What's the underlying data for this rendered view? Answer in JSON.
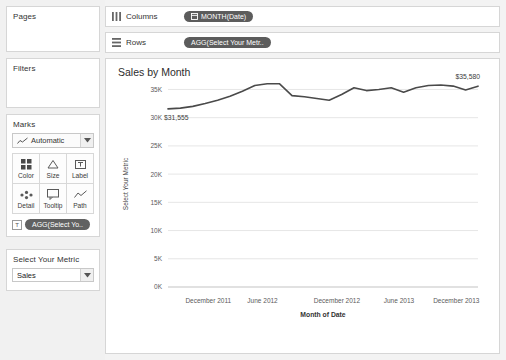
{
  "sidebar": {
    "pages": {
      "title": "Pages"
    },
    "filters": {
      "title": "Filters"
    },
    "marks": {
      "title": "Marks",
      "mark_type": "Automatic",
      "buttons": [
        {
          "label": "Color",
          "icon": "color-icon"
        },
        {
          "label": "Size",
          "icon": "size-icon"
        },
        {
          "label": "Label",
          "icon": "label-icon"
        },
        {
          "label": "Detail",
          "icon": "detail-icon"
        },
        {
          "label": "Tooltip",
          "icon": "tooltip-icon"
        },
        {
          "label": "Path",
          "icon": "path-icon"
        }
      ],
      "pill": "AGG(Select Yo.."
    },
    "parameter": {
      "title": "Select Your Metric",
      "value": "Sales",
      "options": [
        "Sales"
      ]
    }
  },
  "shelves": {
    "columns": {
      "label": "Columns",
      "pill": "MONTH(Date)"
    },
    "rows": {
      "label": "Rows",
      "pill": "AGG(Select Your Metr.."
    }
  },
  "view": {
    "title": "Sales by Month"
  },
  "chart_data": {
    "type": "line",
    "title": "Sales by Month",
    "xlabel": "Month of Date",
    "ylabel": "Select Your Metric",
    "ylim": [
      0,
      36500
    ],
    "yticks": [
      0,
      5000,
      10000,
      15000,
      20000,
      25000,
      30000,
      35000
    ],
    "ytick_labels": [
      "0K",
      "5K",
      "10K",
      "15K",
      "20K",
      "25K",
      "30K",
      "35K"
    ],
    "xticks": [
      "December 2011",
      "June 2012",
      "December 2012",
      "June 2013",
      "December 2013"
    ],
    "grid": true,
    "legend": "none",
    "line_color": "#4a4a4a",
    "annotations": [
      {
        "text": "$31,555",
        "point": "first"
      },
      {
        "text": "$35,580",
        "point": "last"
      }
    ],
    "x": [
      "November 2011",
      "December 2011",
      "January 2012",
      "February 2012",
      "March 2012",
      "April 2012",
      "May 2012",
      "June 2012",
      "July 2012",
      "August 2012",
      "September 2012",
      "October 2012",
      "November 2012",
      "December 2012",
      "January 2013",
      "February 2013",
      "March 2013",
      "April 2013",
      "May 2013",
      "June 2013",
      "July 2013",
      "August 2013",
      "September 2013",
      "October 2013",
      "November 2013",
      "December 2013"
    ],
    "values": [
      31555,
      31700,
      32000,
      32500,
      33100,
      33800,
      34700,
      35700,
      36000,
      36000,
      33900,
      33700,
      33400,
      33100,
      34100,
      35300,
      34800,
      35000,
      35300,
      34500,
      35300,
      35700,
      35800,
      35600,
      34900,
      35580
    ]
  }
}
